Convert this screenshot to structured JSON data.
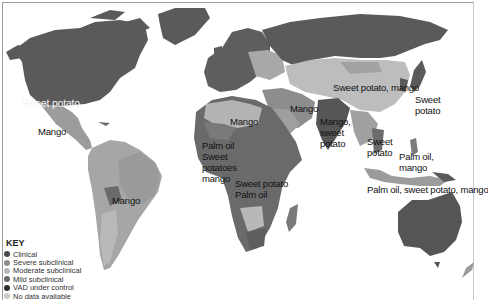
{
  "map": {
    "title": "Vitamin A deficiency and local food sources",
    "labels": [
      {
        "id": "north-america",
        "text": "Sweet potato",
        "x": 21,
        "y": 98,
        "light": true
      },
      {
        "id": "mexico",
        "text": "Mango",
        "x": 38,
        "y": 127,
        "light": false
      },
      {
        "id": "south-america",
        "text": "Mango",
        "x": 112,
        "y": 196,
        "light": false
      },
      {
        "id": "north-africa",
        "text": "Mango",
        "x": 230,
        "y": 117,
        "light": false
      },
      {
        "id": "west-africa-1",
        "text": "Palm oil",
        "x": 202,
        "y": 141,
        "light": false
      },
      {
        "id": "west-africa-2",
        "text": "Sweet",
        "x": 202,
        "y": 152,
        "light": false
      },
      {
        "id": "west-africa-3",
        "text": "potatoes",
        "x": 202,
        "y": 163,
        "light": false
      },
      {
        "id": "west-africa-4",
        "text": "mango",
        "x": 202,
        "y": 174,
        "light": false
      },
      {
        "id": "central-africa-1",
        "text": "Sweet potato",
        "x": 235,
        "y": 179,
        "light": false
      },
      {
        "id": "central-africa-2",
        "text": "Palm oil",
        "x": 235,
        "y": 190,
        "light": false
      },
      {
        "id": "middle-east",
        "text": "Mango",
        "x": 290,
        "y": 104,
        "light": false
      },
      {
        "id": "india-1",
        "text": "Mango,",
        "x": 320,
        "y": 117,
        "light": false
      },
      {
        "id": "india-2",
        "text": "sweet",
        "x": 320,
        "y": 128,
        "light": false
      },
      {
        "id": "india-3",
        "text": "potato",
        "x": 320,
        "y": 139,
        "light": false
      },
      {
        "id": "china",
        "text": "Sweet potato, mango",
        "x": 333,
        "y": 83,
        "light": false
      },
      {
        "id": "japan-1",
        "text": "Sweet",
        "x": 415,
        "y": 95,
        "light": false
      },
      {
        "id": "japan-2",
        "text": "potato",
        "x": 415,
        "y": 106,
        "light": false
      },
      {
        "id": "se-asia-1",
        "text": "Sweet",
        "x": 367,
        "y": 137,
        "light": false
      },
      {
        "id": "se-asia-2",
        "text": "potato",
        "x": 367,
        "y": 148,
        "light": false
      },
      {
        "id": "philippines-1",
        "text": "Palm oil,",
        "x": 399,
        "y": 152,
        "light": false
      },
      {
        "id": "philippines-2",
        "text": "mango",
        "x": 399,
        "y": 163,
        "light": false
      },
      {
        "id": "indonesia",
        "text": "Palm oil, sweet potato, mango",
        "x": 367,
        "y": 185,
        "light": false
      }
    ]
  },
  "legend": {
    "title": "KEY",
    "items": [
      {
        "label": "Clinical",
        "color": "#4a4a4a"
      },
      {
        "label": "Severe subclinical",
        "color": "#8c8c8c"
      },
      {
        "label": "Moderate subclinical",
        "color": "#b8b8b8"
      },
      {
        "label": "Mild subclinical",
        "color": "#6a6a6a"
      },
      {
        "label": "VAD under control",
        "color": "#2e2e2e"
      },
      {
        "label": "No data available",
        "color": "#c9c9c9"
      }
    ]
  },
  "colors": {
    "control": "#5b5b5b",
    "clinical": "#6e6e6e",
    "severe": "#9a9a9a",
    "moderate": "#b7b7b7",
    "mild": "#7c7c7c",
    "water": "#ffffff"
  }
}
